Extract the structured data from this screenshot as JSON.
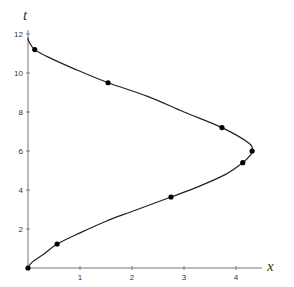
{
  "chart_data": {
    "type": "line",
    "title": "",
    "xlabel": "x",
    "ylabel": "t",
    "xlim": [
      0,
      4.5
    ],
    "ylim": [
      0,
      12
    ],
    "x_ticks": [
      1,
      2,
      3,
      4
    ],
    "y_ticks": [
      2,
      4,
      6,
      8,
      10,
      12
    ],
    "grid": false,
    "legend": null,
    "series": [
      {
        "name": "trajectory",
        "style": "smooth curve",
        "curve_x": [
          0,
          0.08,
          0.3,
          0.56,
          1.0,
          1.5,
          2.0,
          2.75,
          3.3,
          3.8,
          4.13,
          4.28,
          4.31,
          4.25,
          3.73,
          3.0,
          2.3,
          1.54,
          0.9,
          0.4,
          0.13,
          0.02,
          0
        ],
        "curve_t": [
          0,
          0.3,
          0.7,
          1.23,
          1.8,
          2.4,
          2.9,
          3.64,
          4.2,
          4.8,
          5.4,
          5.8,
          6.0,
          6.4,
          7.2,
          8.0,
          8.8,
          9.5,
          10.2,
          10.8,
          11.2,
          11.6,
          11.8
        ]
      },
      {
        "name": "sample points",
        "style": "markers",
        "x": [
          0,
          0.56,
          2.75,
          4.13,
          4.31,
          3.73,
          1.54,
          0.13
        ],
        "t": [
          0,
          1.23,
          3.64,
          5.4,
          6.0,
          7.2,
          9.5,
          11.2
        ]
      }
    ]
  },
  "labels": {
    "x_axis": "x",
    "y_axis": "t",
    "x_ticks": [
      "1",
      "2",
      "3",
      "4"
    ],
    "y_ticks": [
      "2",
      "4",
      "6",
      "8",
      "10",
      "12"
    ]
  }
}
